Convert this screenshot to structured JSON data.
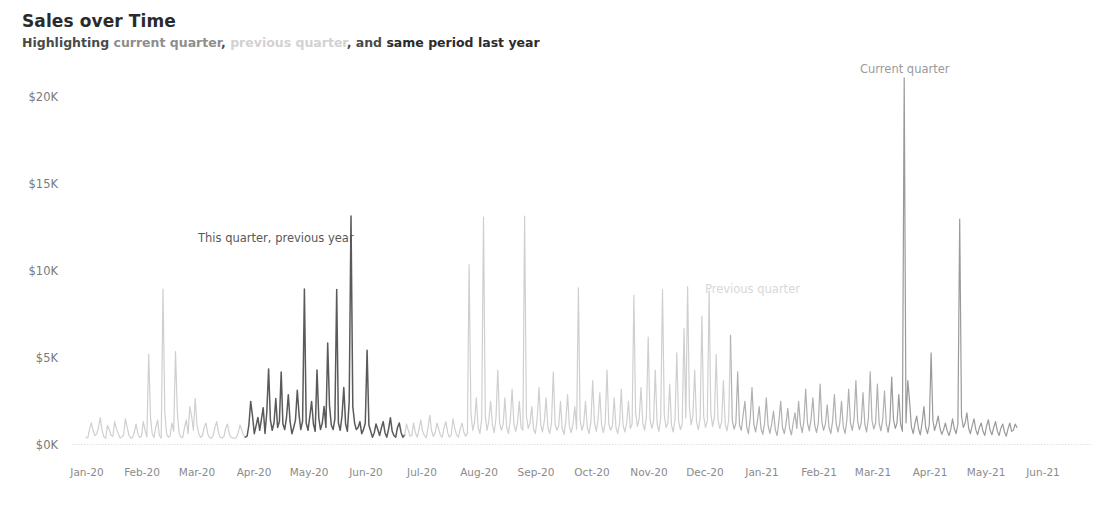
{
  "header": {
    "title": "Sales over Time",
    "subtitle_parts": [
      {
        "text": "Highlighting ",
        "style": "dark"
      },
      {
        "text": "current quarter",
        "style": "mid"
      },
      {
        "text": ", ",
        "style": "dark"
      },
      {
        "text": "previous quarter",
        "style": "light"
      },
      {
        "text": ", and ",
        "style": "dark"
      },
      {
        "text": "same period last year",
        "style": "bolddark"
      }
    ],
    "subtitle_plain": "Highlighting current quarter, previous quarter, and same period last year",
    "sub_highlighting": "Highlighting ",
    "sub_current_quarter": "current quarter",
    "sub_comma1": ", ",
    "sub_previous_quarter": "previous quarter",
    "sub_and": ", and ",
    "sub_same_period": "same period last year"
  },
  "annotations": {
    "same_period_last_year": "This quarter, previous year",
    "previous_quarter": "Previous quarter",
    "current_quarter": "Current quarter"
  },
  "colors": {
    "line_default": "#cfcfcf",
    "line_previous_quarter": "#b0b0b0",
    "line_same_period_last_year": "#5a5a5a",
    "line_current_quarter": "#9a9a9a",
    "axis": "#dedede",
    "tick_text": "#8a8a8a",
    "title_text": "#2b2b2b"
  },
  "chart_data": {
    "type": "line",
    "title": "Sales over Time",
    "subtitle": "Highlighting current quarter, previous quarter, and same period last year",
    "xlabel": "",
    "ylabel": "",
    "ylim": [
      0,
      21500
    ],
    "xlim": [
      "2020-01-01",
      "2021-06-01"
    ],
    "grid": false,
    "legend": "none",
    "y_ticks": [
      0,
      5000,
      10000,
      15000,
      20000
    ],
    "y_tick_labels": [
      "$0K",
      "$5K",
      "$10K",
      "$15K",
      "$20K"
    ],
    "x_tick_labels": [
      "Jan-20",
      "Feb-20",
      "Mar-20",
      "Apr-20",
      "May-20",
      "Jun-20",
      "Jul-20",
      "Aug-20",
      "Sep-20",
      "Oct-20",
      "Nov-20",
      "Dec-20",
      "Jan-21",
      "Feb-21",
      "Mar-21",
      "Apr-21",
      "May-21",
      "Jun-21"
    ],
    "series": [
      {
        "name": "Sales",
        "note": "Daily sales values; segments colored by highlight period",
        "segments": [
          {
            "name": "default-early",
            "color": "#cfcfcf",
            "range_days": [
              0,
              90
            ]
          },
          {
            "name": "same-period-last-year",
            "color": "#5a5a5a",
            "range_days": [
              90,
              181
            ]
          },
          {
            "name": "default-mid",
            "color": "#cfcfcf",
            "range_days": [
              181,
              366
            ]
          },
          {
            "name": "previous-quarter",
            "color": "#b0b0b0",
            "range_days": [
              366,
              455
            ]
          },
          {
            "name": "current-quarter",
            "color": "#9a9a9a",
            "range_days": [
              455,
              528
            ]
          }
        ],
        "values": [
          420,
          380,
          900,
          1250,
          760,
          520,
          610,
          980,
          1540,
          820,
          430,
          360,
          1100,
          860,
          520,
          470,
          1320,
          910,
          640,
          380,
          420,
          560,
          1480,
          980,
          520,
          360,
          410,
          700,
          1180,
          620,
          410,
          480,
          1320,
          820,
          430,
          5200,
          1550,
          620,
          410,
          980,
          1420,
          520,
          360,
          8950,
          1840,
          620,
          410,
          520,
          1240,
          760,
          5350,
          1920,
          640,
          430,
          390,
          980,
          1420,
          620,
          2180,
          1640,
          820,
          2650,
          1120,
          620,
          410,
          520,
          980,
          1240,
          620,
          410,
          360,
          520,
          980,
          1320,
          680,
          420,
          380,
          450,
          920,
          1180,
          640,
          420,
          380,
          360,
          420,
          680,
          1120,
          820,
          540,
          420,
          480,
          1120,
          2480,
          1640,
          620,
          1080,
          1560,
          820,
          1480,
          2120,
          640,
          1860,
          4350,
          1420,
          820,
          1240,
          2640,
          980,
          1320,
          4180,
          1180,
          860,
          1540,
          2860,
          1320,
          620,
          980,
          1420,
          3120,
          1680,
          860,
          1340,
          8950,
          1240,
          820,
          1620,
          2480,
          1180,
          760,
          4280,
          1520,
          860,
          1240,
          2180,
          980,
          5840,
          2240,
          1120,
          860,
          1480,
          8920,
          1240,
          820,
          1640,
          3280,
          1180,
          760,
          2480,
          13150,
          2180,
          1240,
          860,
          980,
          1320,
          620,
          860,
          1240,
          5420,
          1120,
          760,
          420,
          680,
          1180,
          860,
          520,
          960,
          1320,
          680,
          420,
          880,
          1540,
          760,
          520,
          420,
          980,
          1240,
          680,
          420,
          560,
          1180,
          820,
          480,
          520,
          1240,
          680,
          420,
          860,
          1420,
          760,
          520,
          380,
          920,
          1680,
          820,
          460,
          640,
          1240,
          880,
          520,
          420,
          980,
          1320,
          680,
          420,
          560,
          1480,
          920,
          560,
          420,
          880,
          1240,
          720,
          480,
          620,
          10350,
          1840,
          820,
          1240,
          2680,
          980,
          620,
          1480,
          13080,
          1620,
          820,
          1340,
          2480,
          1120,
          680,
          1540,
          4280,
          1240,
          820,
          1180,
          2680,
          980,
          620,
          1420,
          3180,
          1180,
          760,
          1240,
          2480,
          980,
          820,
          13150,
          1640,
          920,
          1240,
          2180,
          860,
          640,
          1480,
          3280,
          1120,
          720,
          1340,
          2680,
          980,
          620,
          1240,
          4180,
          1180,
          820,
          1060,
          2480,
          920,
          580,
          1320,
          2880,
          1040,
          680,
          1180,
          2180,
          880,
          9020,
          1420,
          820,
          1180,
          2480,
          980,
          620,
          1320,
          3680,
          1240,
          760,
          1480,
          2980,
          1120,
          680,
          1240,
          4280,
          1180,
          820,
          1060,
          2680,
          980,
          620,
          1180,
          3180,
          1080,
          720,
          1240,
          2480,
          920,
          1180,
          8580,
          1820,
          1040,
          1480,
          3280,
          1240,
          820,
          1620,
          6180,
          1480,
          920,
          1340,
          4280,
          1180,
          760,
          1520,
          8920,
          1680,
          980,
          1240,
          3480,
          1120,
          720,
          1420,
          5280,
          1340,
          860,
          1180,
          6680,
          1520,
          9080,
          2180,
          1120,
          1640,
          4280,
          1320,
          860,
          1480,
          7380,
          1620,
          980,
          1340,
          8850,
          1820,
          1040,
          1560,
          5180,
          1420,
          920,
          1280,
          3680,
          1180,
          780,
          1420,
          6280,
          1380,
          880,
          1240,
          4180,
          1120,
          820,
          1680,
          2480,
          1020,
          620,
          1480,
          3280,
          1180,
          720,
          1340,
          2180,
          920,
          580,
          1240,
          2680,
          1080,
          640,
          1180,
          1920,
          860,
          520,
          1320,
          2480,
          980,
          620,
          1180,
          2080,
          920,
          560,
          1240,
          1820,
          920,
          2480,
          1180,
          680,
          1340,
          3180,
          1240,
          780,
          1480,
          2680,
          1120,
          680,
          1240,
          3480,
          1320,
          820,
          1180,
          2280,
          980,
          620,
          1340,
          2880,
          1180,
          720,
          1240,
          2480,
          1020,
          640,
          1420,
          3180,
          1240,
          820,
          1480,
          3680,
          1320,
          860,
          1240,
          2980,
          1180,
          720,
          1520,
          4180,
          1380,
          880,
          1240,
          3480,
          1240,
          780,
          1420,
          3080,
          1180,
          720,
          1340,
          3880,
          1420,
          920,
          1240,
          2880,
          1180,
          760,
          21100,
          1240,
          3680,
          2480,
          1020,
          620,
          1180,
          1640,
          920,
          560,
          1240,
          2180,
          980,
          620,
          1120,
          5280,
          1380,
          820,
          1180,
          1640,
          920,
          580,
          860,
          1240,
          780,
          520,
          880,
          1480,
          920,
          620,
          1180,
          12980,
          1640,
          980,
          1240,
          1820,
          920,
          620,
          1080,
          1480,
          860,
          560,
          980,
          1240,
          760,
          520,
          1080,
          1420,
          820,
          560,
          980,
          1320,
          780,
          520,
          940,
          1180,
          720,
          480,
          900,
          1240,
          760,
          820,
          1180,
          980
        ]
      }
    ]
  }
}
